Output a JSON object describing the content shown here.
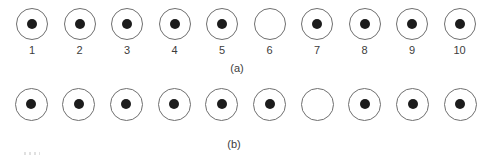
{
  "figure": {
    "colors": {
      "background": "#ffffff",
      "outline": "#6f6f6f",
      "dot": "#1c1c1c",
      "text": "#3c3c3c"
    },
    "rows": [
      {
        "id": "a",
        "caption": "(a)",
        "show_numbers": true,
        "circles": [
          {
            "number": "1",
            "filled": true
          },
          {
            "number": "2",
            "filled": true
          },
          {
            "number": "3",
            "filled": true
          },
          {
            "number": "4",
            "filled": true
          },
          {
            "number": "5",
            "filled": true
          },
          {
            "number": "6",
            "filled": false
          },
          {
            "number": "7",
            "filled": true
          },
          {
            "number": "8",
            "filled": true
          },
          {
            "number": "9",
            "filled": true
          },
          {
            "number": "10",
            "filled": true
          }
        ]
      },
      {
        "id": "b",
        "caption": "(b)",
        "show_numbers": false,
        "circles": [
          {
            "number": "1",
            "filled": true
          },
          {
            "number": "2",
            "filled": true
          },
          {
            "number": "3",
            "filled": true
          },
          {
            "number": "4",
            "filled": true
          },
          {
            "number": "5",
            "filled": true
          },
          {
            "number": "6",
            "filled": true
          },
          {
            "number": "7",
            "filled": false
          },
          {
            "number": "8",
            "filled": true
          },
          {
            "number": "9",
            "filled": true
          },
          {
            "number": "10",
            "filled": true
          }
        ]
      }
    ]
  }
}
